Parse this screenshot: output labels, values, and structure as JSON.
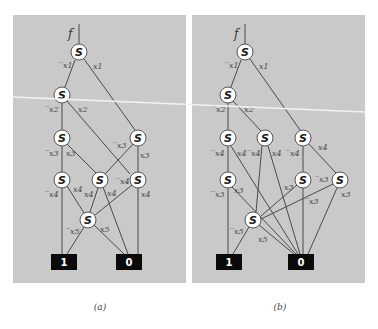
{
  "figure": {
    "panels": [
      {
        "id": "a",
        "caption": "(a)",
        "function_label": "f",
        "node_label": "S",
        "terminals": [
          {
            "id": "t1",
            "label": "1"
          },
          {
            "id": "t0",
            "label": "0"
          }
        ],
        "nodes": [
          {
            "id": "n1",
            "label": "S"
          },
          {
            "id": "n2",
            "label": "S"
          },
          {
            "id": "n3a",
            "label": "S"
          },
          {
            "id": "n3b",
            "label": "S"
          },
          {
            "id": "n4a",
            "label": "S"
          },
          {
            "id": "n4b",
            "label": "S"
          },
          {
            "id": "n4c",
            "label": "S"
          },
          {
            "id": "n5",
            "label": "S"
          }
        ],
        "edge_labels": {
          "n1_neg": "x1",
          "n1_pos": "x1",
          "n2_neg": "x2",
          "n2_pos": "x2",
          "n3a_neg": "x3",
          "n3a_pos": "x3",
          "n3b_neg": "x3",
          "n3b_pos": "x3",
          "n4a_neg": "x4",
          "n4a_pos": "x4",
          "n4b_pos": "x4",
          "n4b_neg": "x4",
          "n4c_neg": "x4",
          "n4c_pos": "x4",
          "n5_neg": "x5",
          "n5_pos": "x5"
        }
      },
      {
        "id": "b",
        "caption": "(b)",
        "function_label": "f",
        "node_label": "S",
        "terminals": [
          {
            "id": "t1",
            "label": "1"
          },
          {
            "id": "t0",
            "label": "0"
          }
        ],
        "nodes": [
          {
            "id": "n1",
            "label": "S"
          },
          {
            "id": "n2",
            "label": "S"
          },
          {
            "id": "n3a",
            "label": "S"
          },
          {
            "id": "n3b",
            "label": "S"
          },
          {
            "id": "n3c",
            "label": "S"
          },
          {
            "id": "n4a",
            "label": "S"
          },
          {
            "id": "n4b",
            "label": "S"
          },
          {
            "id": "n4c",
            "label": "S"
          },
          {
            "id": "n5",
            "label": "S"
          }
        ],
        "edge_labels": {
          "n1_neg": "x1",
          "n1_pos": "x1",
          "n2_neg": "x2",
          "n2_pos": "x2",
          "n3a_neg": "x4",
          "n3a_pos": "x4",
          "n3b_neg": "x4",
          "n3b_pos": "x4",
          "n3c_neg": "x4",
          "n3c_pos": "x4",
          "n4a_neg": "x3",
          "n4a_pos": "x3",
          "n4b_pos": "x3",
          "n4b_neg": "x3",
          "n4c_neg": "x3",
          "n4c_pos": "x3",
          "n5_neg": "x5",
          "n5_pos": "x5"
        }
      }
    ]
  }
}
